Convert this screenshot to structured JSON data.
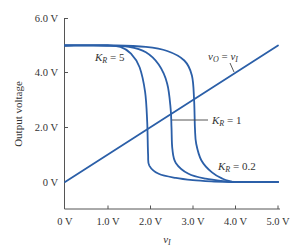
{
  "chart_data": {
    "type": "line",
    "title": "",
    "xlabel": "v_I",
    "ylabel": "Output voltage",
    "xlim": [
      0,
      5.0
    ],
    "ylim": [
      -1.0,
      6.0
    ],
    "grid": false,
    "legend": "none (inline annotations)",
    "x_ticks": [
      "0 V",
      "1.0 V",
      "2.0 V",
      "3.0 V",
      "4.0 V",
      "5.0 V"
    ],
    "y_ticks": [
      "0 V",
      "2.0 V",
      "4.0 V",
      "6.0 V"
    ],
    "series_color": "#2b5fa8",
    "series": [
      {
        "name": "K_R = 5",
        "label": "K_R = 5",
        "points": [
          [
            0,
            5.0
          ],
          [
            1.0,
            5.0
          ],
          [
            1.3,
            4.95
          ],
          [
            1.55,
            4.7
          ],
          [
            1.75,
            4.2
          ],
          [
            1.88,
            3.3
          ],
          [
            1.93,
            2.2
          ],
          [
            1.95,
            1.0
          ],
          [
            1.98,
            0.6
          ],
          [
            2.2,
            0.3
          ],
          [
            2.6,
            0.15
          ],
          [
            3.0,
            0.07
          ],
          [
            3.5,
            0.02
          ],
          [
            4.0,
            0.0
          ],
          [
            5.0,
            0.0
          ]
        ]
      },
      {
        "name": "K_R = 1",
        "label": "K_R = 1",
        "points": [
          [
            0,
            5.0
          ],
          [
            1.0,
            5.0
          ],
          [
            1.5,
            4.95
          ],
          [
            1.9,
            4.75
          ],
          [
            2.2,
            4.3
          ],
          [
            2.4,
            3.6
          ],
          [
            2.48,
            2.7
          ],
          [
            2.5,
            2.0
          ],
          [
            2.52,
            1.2
          ],
          [
            2.6,
            0.7
          ],
          [
            2.9,
            0.3
          ],
          [
            3.3,
            0.12
          ],
          [
            3.8,
            0.02
          ],
          [
            4.0,
            0.0
          ],
          [
            5.0,
            0.0
          ]
        ]
      },
      {
        "name": "K_R = 0.2",
        "label": "K_R = 0.2",
        "points": [
          [
            0,
            5.0
          ],
          [
            1.2,
            5.0
          ],
          [
            1.9,
            4.95
          ],
          [
            2.4,
            4.8
          ],
          [
            2.8,
            4.45
          ],
          [
            2.98,
            3.9
          ],
          [
            3.03,
            3.0
          ],
          [
            3.05,
            2.0
          ],
          [
            3.08,
            1.4
          ],
          [
            3.2,
            0.8
          ],
          [
            3.45,
            0.35
          ],
          [
            3.7,
            0.12
          ],
          [
            3.9,
            0.02
          ],
          [
            4.0,
            0.0
          ],
          [
            5.0,
            0.0
          ]
        ]
      },
      {
        "name": "v_O = v_I",
        "label": "v_O = v_I",
        "points": [
          [
            0,
            0
          ],
          [
            5.0,
            5.0
          ]
        ]
      }
    ],
    "annotations": [
      {
        "text": "K_R = 5",
        "near": [
          1.2,
          4.7
        ]
      },
      {
        "text": "K_R = 1",
        "near": [
          3.45,
          2.3
        ],
        "leader_to": [
          2.5,
          2.3
        ]
      },
      {
        "text": "K_R = 0.2",
        "near": [
          3.6,
          0.5
        ]
      },
      {
        "text": "v_O = v_I",
        "near": [
          3.4,
          4.9
        ],
        "leader_to": [
          3.6,
          4.2
        ]
      }
    ]
  },
  "axes": {
    "x_ticks": [
      "0 V",
      "1.0 V",
      "2.0 V",
      "3.0 V",
      "4.0 V",
      "5.0 V"
    ],
    "y_ticks": [
      "6.0 V",
      "4.0 V",
      "2.0 V",
      "0 V"
    ],
    "x_title_main": "v",
    "x_title_sub": "I",
    "y_title": "Output voltage"
  },
  "labels": {
    "kr5": {
      "k": "K",
      "sub": "R",
      "rest": " = 5"
    },
    "kr1": {
      "k": "K",
      "sub": "R",
      "rest": " = 1"
    },
    "kr02": {
      "k": "K",
      "sub": "R",
      "rest": " = 0.2"
    },
    "vovi": {
      "v1": "v",
      "sub1": "O",
      "eq": " = ",
      "v2": "v",
      "sub2": "I"
    }
  }
}
